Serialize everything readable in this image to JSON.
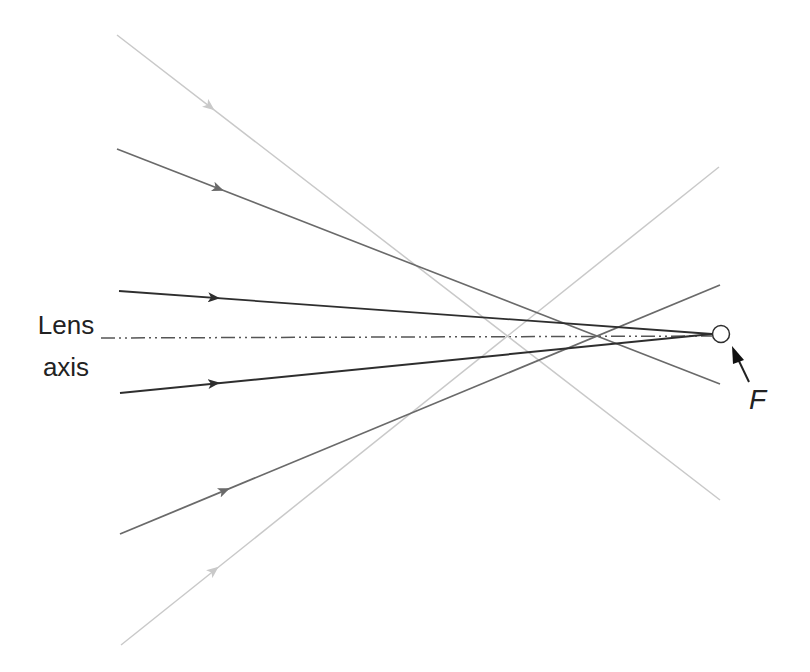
{
  "labels": {
    "lens_axis_line1": "Lens",
    "lens_axis_line2": "axis",
    "focal_point": "F"
  },
  "colors": {
    "dark_ray": "#2e2e2e",
    "medium_ray": "#6a6a6a",
    "light_ray": "#c9c9c9",
    "axis": "#555555",
    "background": "#ffffff"
  },
  "diagram": {
    "axis": {
      "x1": 101,
      "y1": 338,
      "x2": 712,
      "y2": 336,
      "style": "dash-dot-dot"
    },
    "focal_circle": {
      "cx": 721,
      "cy": 334,
      "r": 8.5
    },
    "focal_pointer": {
      "x1": 749,
      "y1": 382,
      "x2": 733,
      "y2": 348
    },
    "rays": [
      {
        "name": "light-ray-top",
        "shade": "light",
        "x1": 117,
        "y1": 35,
        "x2": 720,
        "y2": 500,
        "arrow_at": [
          213,
          83
        ]
      },
      {
        "name": "medium-ray-upper",
        "shade": "medium",
        "x1": 117,
        "y1": 149,
        "x2": 720,
        "y2": 384,
        "arrow_at": [
          222,
          190
        ]
      },
      {
        "name": "dark-ray-upper",
        "shade": "dark",
        "x1": 119,
        "y1": 291,
        "x2": 712,
        "y2": 334,
        "arrow_at": [
          218,
          298
        ]
      },
      {
        "name": "dark-ray-lower",
        "shade": "dark",
        "x1": 120,
        "y1": 393,
        "x2": 712,
        "y2": 334,
        "arrow_at": [
          218,
          383
        ]
      },
      {
        "name": "medium-ray-lower",
        "shade": "medium",
        "x1": 120,
        "y1": 534,
        "x2": 720,
        "y2": 285,
        "arrow_at": [
          228,
          489
        ]
      },
      {
        "name": "light-ray-bottom",
        "shade": "light",
        "x1": 121,
        "y1": 645,
        "x2": 719,
        "y2": 167,
        "arrow_at": [
          217,
          568
        ]
      }
    ]
  }
}
